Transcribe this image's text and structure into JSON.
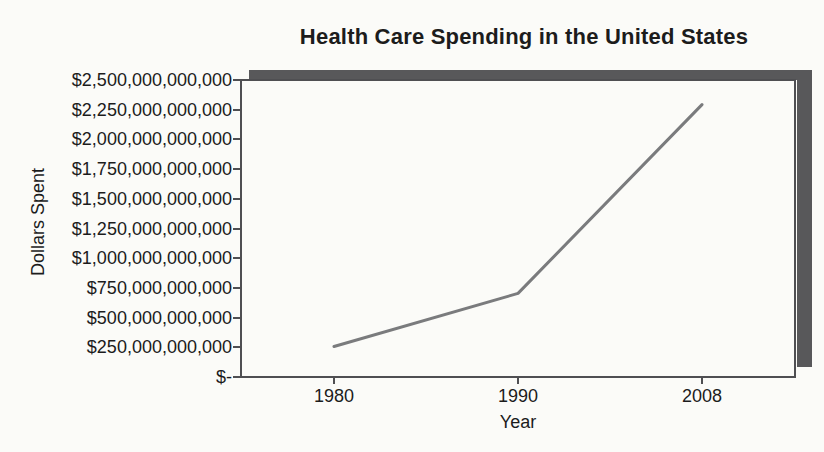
{
  "chart_data": {
    "type": "line",
    "title": "Health Care Spending in the United States",
    "xlabel": "Year",
    "ylabel": "Dollars Spent",
    "categories": [
      "1980",
      "1990",
      "2008"
    ],
    "series": [
      {
        "name": "Health care spending",
        "values": [
          250000000000,
          700000000000,
          2300000000000
        ]
      }
    ],
    "ylim": [
      0,
      2500000000000
    ],
    "y_tick_step": 250000000000,
    "y_tick_labels_top_to_bottom": [
      "$2,500,000,000,000",
      "$2,250,000,000,000",
      "$2,000,000,000,000",
      "$1,750,000,000,000",
      "$1,500,000,000,000",
      "$1,250,000,000,000",
      "$1,000,000,000,000",
      "$750,000,000,000",
      "$500,000,000,000",
      "$250,000,000,000",
      "$-"
    ],
    "grid": false,
    "legend": false,
    "colors": {
      "line": "#7a7b7d",
      "frame_shadow": "#58585a",
      "axis": "#4f4f52",
      "text": "#1c1c1c",
      "background": "#fbfbf8"
    }
  }
}
